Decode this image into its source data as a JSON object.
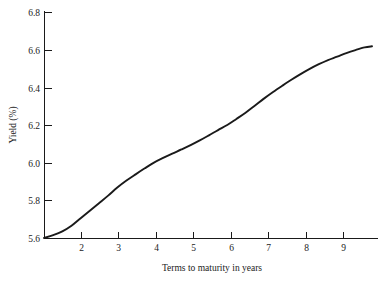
{
  "chart_data": {
    "type": "line",
    "title": "",
    "subtitle": "",
    "xlabel": "Terms to maturity in years",
    "ylabel": "Yield (%)",
    "xlim": [
      1.0,
      9.95
    ],
    "ylim": [
      5.6,
      6.8
    ],
    "grid": false,
    "legend": null,
    "legend_position": "none",
    "line_color": "#1a1a1a",
    "background_color": "#ffffff",
    "axis_color": "#1a1a1a",
    "x_ticks": [
      2,
      3,
      4,
      5,
      6,
      7,
      8,
      9
    ],
    "x_tick_labels": [
      "2",
      "3",
      "4",
      "5",
      "6",
      "7",
      "8",
      "9"
    ],
    "y_ticks": [
      5.6,
      5.8,
      6.0,
      6.2,
      6.4,
      6.6,
      6.8
    ],
    "y_tick_labels": [
      "5.6",
      "5.8",
      "6.0",
      "6.2",
      "6.4",
      "6.6",
      "6.8"
    ],
    "series": [
      {
        "name": "yield-curve",
        "x": [
          1.0,
          1.25,
          1.5,
          1.75,
          2.0,
          2.25,
          2.5,
          2.75,
          3.0,
          3.25,
          3.5,
          3.75,
          4.0,
          4.25,
          4.5,
          4.75,
          5.0,
          5.25,
          5.5,
          5.75,
          6.0,
          6.25,
          6.5,
          6.75,
          7.0,
          7.25,
          7.5,
          7.75,
          8.0,
          8.25,
          8.5,
          8.75,
          9.0,
          9.25,
          9.5,
          9.75,
          9.95
        ],
        "y": [
          5.6,
          5.615,
          5.635,
          5.665,
          5.705,
          5.745,
          5.785,
          5.825,
          5.868,
          5.905,
          5.938,
          5.97,
          6.0,
          6.025,
          6.048,
          6.07,
          6.093,
          6.118,
          6.145,
          6.173,
          6.2,
          6.232,
          6.265,
          6.302,
          6.34,
          6.375,
          6.408,
          6.44,
          6.47,
          6.498,
          6.523,
          6.545,
          6.563,
          6.582,
          6.598,
          6.612,
          6.618
        ]
      }
    ]
  },
  "layout": {
    "plot_left_px": 44,
    "plot_right_px": 378,
    "plot_top_px": 12,
    "plot_bottom_px": 238,
    "x_axis_end_px": 378,
    "curve_end_px": 372
  }
}
